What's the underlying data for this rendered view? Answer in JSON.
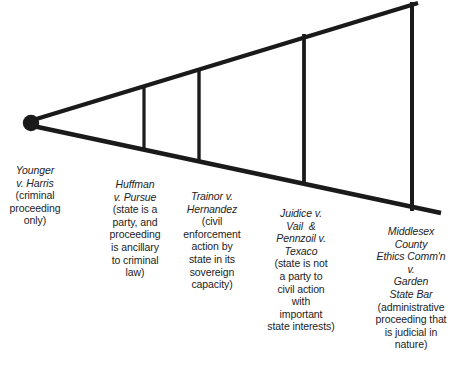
{
  "diagram": {
    "type": "funnel-progression",
    "apex_marker": "filled-circle",
    "stroke_color": "#1a1a1a",
    "background_color": "#ffffff",
    "stages": [
      {
        "case": "Younger\nv. Harris",
        "description": "(criminal\nproceeding\nonly)"
      },
      {
        "case": "Huffman\nv. Pursue",
        "description": "(state is a\nparty, and\nproceeding\nis ancillary\nto criminal\nlaw)"
      },
      {
        "case": "Trainor v.\nHernandez",
        "description": "(civil\nenforcement\naction by\nstate in its\nsovereign\ncapacity)"
      },
      {
        "case": "Juidice v.\nVail  &\nPennzoil v.\nTexaco",
        "description": "(state is not\na party to\ncivil action\nwith\nimportant\nstate interests)"
      },
      {
        "case": "Middlesex\nCounty\nEthics Comm'n\nv.\nGarden\nState Bar",
        "description": "(administrative\nproceeding that\nis judicial in\nnature)"
      }
    ]
  }
}
